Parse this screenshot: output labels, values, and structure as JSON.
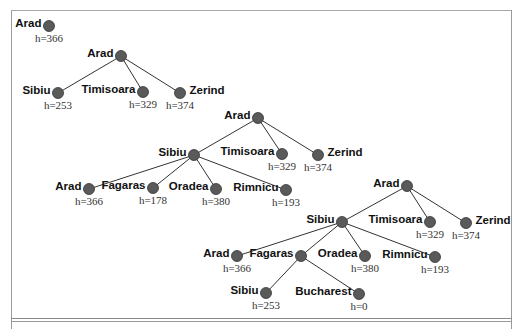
{
  "diagram": {
    "type": "greedy-best-first-search-trees",
    "stages": [
      {
        "id": "stage-1",
        "nodes": [
          {
            "id": "s1-arad",
            "label": "Arad",
            "h": "h=366",
            "x": 49,
            "y": 26
          }
        ],
        "edges": []
      },
      {
        "id": "stage-2",
        "nodes": [
          {
            "id": "s2-arad",
            "label": "Arad",
            "h": "",
            "x": 121,
            "y": 56
          },
          {
            "id": "s2-sibiu",
            "label": "Sibiu",
            "h": "h=253",
            "x": 58,
            "y": 93
          },
          {
            "id": "s2-timisoara",
            "label": "Timisoara",
            "h": "h=329",
            "x": 143,
            "y": 92
          },
          {
            "id": "s2-zerind",
            "label": "Zerind",
            "h": "h=374",
            "x": 180,
            "y": 93,
            "label_right": true
          }
        ],
        "edges": [
          [
            "s2-arad",
            "s2-sibiu"
          ],
          [
            "s2-arad",
            "s2-timisoara"
          ],
          [
            "s2-arad",
            "s2-zerind"
          ]
        ]
      },
      {
        "id": "stage-3",
        "nodes": [
          {
            "id": "s3-arad",
            "label": "Arad",
            "h": "",
            "x": 258,
            "y": 118
          },
          {
            "id": "s3-sibiu",
            "label": "Sibiu",
            "h": "",
            "x": 194,
            "y": 155
          },
          {
            "id": "s3-timisoara",
            "label": "Timisoara",
            "h": "h=329",
            "x": 282,
            "y": 154
          },
          {
            "id": "s3-zerind",
            "label": "Zerind",
            "h": "h=374",
            "x": 318,
            "y": 155,
            "label_right": true
          },
          {
            "id": "s3-arad2",
            "label": "Arad",
            "h": "h=366",
            "x": 89,
            "y": 189
          },
          {
            "id": "s3-fagaras",
            "label": "Fagaras",
            "h": "h=178",
            "x": 153,
            "y": 188
          },
          {
            "id": "s3-oradea",
            "label": "Oradea",
            "h": "h=380",
            "x": 216,
            "y": 189
          },
          {
            "id": "s3-rimnicu",
            "label": "Rimnicu",
            "h": "h=193",
            "x": 286,
            "y": 190
          }
        ],
        "edges": [
          [
            "s3-arad",
            "s3-sibiu"
          ],
          [
            "s3-arad",
            "s3-timisoara"
          ],
          [
            "s3-arad",
            "s3-zerind"
          ],
          [
            "s3-sibiu",
            "s3-arad2"
          ],
          [
            "s3-sibiu",
            "s3-fagaras"
          ],
          [
            "s3-sibiu",
            "s3-oradea"
          ],
          [
            "s3-sibiu",
            "s3-rimnicu"
          ]
        ]
      },
      {
        "id": "stage-4",
        "nodes": [
          {
            "id": "s4-arad",
            "label": "Arad",
            "h": "",
            "x": 407,
            "y": 186
          },
          {
            "id": "s4-sibiu",
            "label": "Sibiu",
            "h": "",
            "x": 342,
            "y": 222
          },
          {
            "id": "s4-timisoara",
            "label": "Timisoara",
            "h": "h=329",
            "x": 430,
            "y": 222
          },
          {
            "id": "s4-zerind",
            "label": "Zerind",
            "h": "h=374",
            "x": 466,
            "y": 223,
            "label_right": true
          },
          {
            "id": "s4-arad2",
            "label": "Arad",
            "h": "h=366",
            "x": 237,
            "y": 256
          },
          {
            "id": "s4-fagaras",
            "label": "Fagaras",
            "h": "",
            "x": 301,
            "y": 256
          },
          {
            "id": "s4-oradea",
            "label": "Oradea",
            "h": "h=380",
            "x": 365,
            "y": 256
          },
          {
            "id": "s4-rimnicu",
            "label": "Rimnicu",
            "h": "h=193",
            "x": 435,
            "y": 257
          },
          {
            "id": "s4-sibiu2",
            "label": "Sibiu",
            "h": "h=253",
            "x": 266,
            "y": 293
          },
          {
            "id": "s4-bucharest",
            "label": "Bucharest",
            "h": "h=0",
            "x": 359,
            "y": 294
          }
        ],
        "edges": [
          [
            "s4-arad",
            "s4-sibiu"
          ],
          [
            "s4-arad",
            "s4-timisoara"
          ],
          [
            "s4-arad",
            "s4-zerind"
          ],
          [
            "s4-sibiu",
            "s4-arad2"
          ],
          [
            "s4-sibiu",
            "s4-fagaras"
          ],
          [
            "s4-sibiu",
            "s4-oradea"
          ],
          [
            "s4-sibiu",
            "s4-rimnicu"
          ],
          [
            "s4-fagaras",
            "s4-sibiu2"
          ],
          [
            "s4-fagaras",
            "s4-bucharest"
          ]
        ]
      }
    ]
  },
  "colors": {
    "node_fill": "#5a5a5a",
    "edge": "#333333",
    "frame": "#9a9a9a"
  }
}
